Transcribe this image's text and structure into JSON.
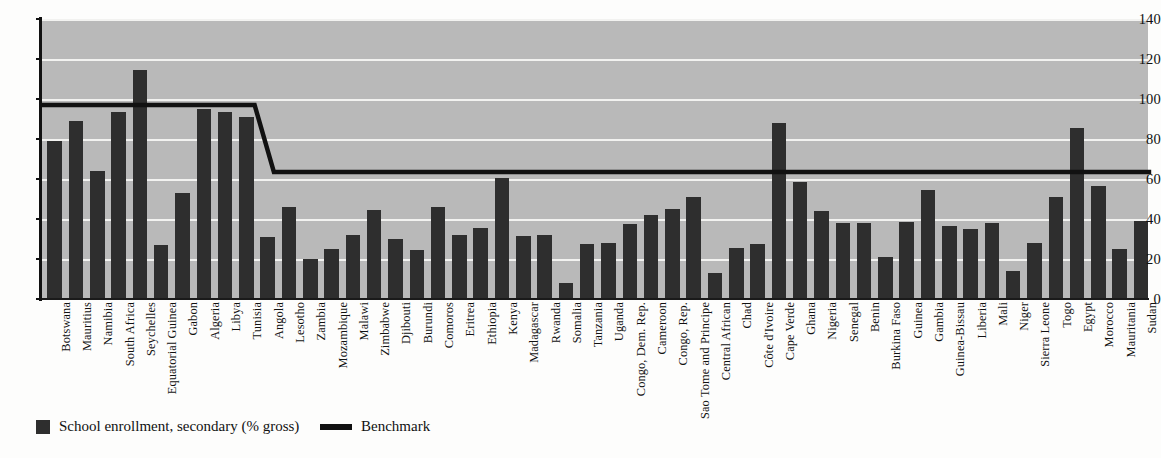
{
  "chart_data": {
    "type": "bar",
    "title": "",
    "subtitle": "",
    "xlabel": "",
    "ylabel": "",
    "ylim": [
      0,
      140
    ],
    "ytick_step": 20,
    "yticks": [
      0,
      20,
      40,
      60,
      80,
      100,
      120,
      140
    ],
    "grid": true,
    "legend_position": "bottom-left",
    "categories": [
      "Botswana",
      "Mauritius",
      "Namibia",
      "South Africa",
      "Seychelles",
      "Equatorial Guinea",
      "Gabon",
      "Algeria",
      "Libya",
      "Tunisia",
      "Angola",
      "Lesotho",
      "Zambia",
      "Mozambique",
      "Malawi",
      "Zimbabwe",
      "Djibouti",
      "Burundi",
      "Comoros",
      "Eritrea",
      "Ethiopia",
      "Kenya",
      "Madagascar",
      "Rwanda",
      "Somalia",
      "Tanzania",
      "Uganda",
      "Congo, Dem. Rep.",
      "Cameroon",
      "Congo, Rep.",
      "Sao Tome and Principe",
      "Central African",
      "Chad",
      "Côte d'Ivoire",
      "Cape Verde",
      "Ghana",
      "Nigeria",
      "Senegal",
      "Benin",
      "Burkina Faso",
      "Guinea",
      "Gambia",
      "Guinea-Bissau",
      "Liberia",
      "Mali",
      "Niger",
      "Sierra Leone",
      "Togo",
      "Egypt",
      "Morocco",
      "Mauritania",
      "Sudan"
    ],
    "series": [
      {
        "name": "School enrollment, secondary (% gross)",
        "type": "bar",
        "color": "#2e2e2e",
        "values": [
          79,
          89,
          64,
          93.5,
          114.5,
          27,
          53,
          95,
          93.5,
          91,
          31,
          46,
          20,
          25,
          32,
          44.5,
          30,
          24.5,
          46,
          32,
          35.5,
          60.5,
          31.5,
          32,
          8,
          27.5,
          28,
          37.5,
          42,
          45,
          51,
          13,
          25.5,
          27.5,
          88,
          58.5,
          44,
          38,
          38,
          21,
          38.5,
          54.5,
          36.5,
          35,
          38,
          14,
          28,
          51,
          85.5,
          56.5,
          25,
          39
        ]
      },
      {
        "name": "Benchmark",
        "type": "line",
        "color": "#111111",
        "description": "Step line: 97 across the first 10 countries, descending to 63.5 from Angola onward",
        "levels": [
          {
            "value": 97,
            "from_index": 0,
            "to_index": 9
          },
          {
            "value": 63.5,
            "from_index": 10,
            "to_index": 51
          }
        ]
      }
    ]
  },
  "legend": {
    "items": [
      {
        "label": "School enrollment, secondary (% gross)",
        "marker": "bar-swatch",
        "color": "#2e2e2e"
      },
      {
        "label": "Benchmark",
        "marker": "line-swatch",
        "color": "#111111"
      }
    ]
  },
  "axis": {
    "y_tick_labels": [
      "140",
      "120",
      "100",
      "80",
      "60",
      "40",
      "20",
      "0"
    ]
  }
}
